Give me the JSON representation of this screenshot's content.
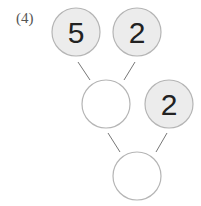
{
  "problem": {
    "label": "(4)",
    "nodes": [
      {
        "id": "top-left",
        "value": "5",
        "filled": true,
        "cx": 76,
        "cy": 32
      },
      {
        "id": "top-right",
        "value": "2",
        "filled": true,
        "cx": 137,
        "cy": 32
      },
      {
        "id": "middle",
        "value": "",
        "filled": false,
        "cx": 106,
        "cy": 104
      },
      {
        "id": "middle-right",
        "value": "2",
        "filled": true,
        "cx": 169,
        "cy": 104
      },
      {
        "id": "bottom",
        "value": "",
        "filled": false,
        "cx": 137,
        "cy": 176
      }
    ],
    "colors": {
      "filled": "#ececec",
      "stroke": "#b5b5b5",
      "line": "#777777"
    }
  }
}
